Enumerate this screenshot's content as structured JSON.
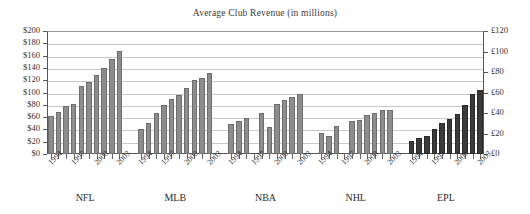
{
  "chart_data": {
    "type": "bar",
    "title": "Average Club Revenue (in millions)",
    "xlabel": "",
    "ylabel": "",
    "ylim": [
      0,
      200
    ],
    "y2lim": [
      0,
      120
    ],
    "grid": true,
    "legend": "none",
    "y_axis_left": {
      "ticks": [
        "$0",
        "$20",
        "$40",
        "$60",
        "$80",
        "$100",
        "$120",
        "$140",
        "$160",
        "$180",
        "$200"
      ],
      "values": [
        0,
        20,
        40,
        60,
        80,
        100,
        120,
        140,
        160,
        180,
        200
      ],
      "currency": "USD"
    },
    "y_axis_right": {
      "ticks": [
        "£0",
        "£20",
        "£40",
        "£60",
        "£80",
        "£100",
        "£120"
      ],
      "values": [
        0,
        20,
        40,
        60,
        80,
        100,
        120
      ],
      "currency": "GBP"
    },
    "x": [
      1994,
      1995,
      1996,
      1997,
      1998,
      1999,
      2000,
      2001,
      2002,
      2003
    ],
    "x_tick_labels": [
      "1994",
      "1997",
      "2000",
      "2003"
    ],
    "x_tick_label_indices": [
      0,
      3,
      6,
      9
    ],
    "groups": [
      {
        "name": "NFL",
        "color": "#8d8d8d",
        "values": [
          62,
          68,
          78,
          82,
          110,
          117,
          128,
          140,
          155,
          167
        ]
      },
      {
        "name": "MLB",
        "color": "#8d8d8d",
        "values": [
          41,
          51,
          66,
          80,
          90,
          96,
          107,
          121,
          123,
          131
        ]
      },
      {
        "name": "NBA",
        "color": "#8d8d8d",
        "values": [
          48,
          53,
          59,
          null,
          66,
          44,
          81,
          88,
          93,
          97
        ]
      },
      {
        "name": "NHL",
        "color": "#8d8d8d",
        "values": [
          34,
          30,
          45,
          null,
          54,
          56,
          63,
          66,
          72,
          72
        ]
      },
      {
        "name": "EPL",
        "color": "#3a3a3a",
        "values": [
          21,
          26,
          30,
          40,
          51,
          57,
          65,
          79,
          97,
          104
        ]
      }
    ]
  }
}
